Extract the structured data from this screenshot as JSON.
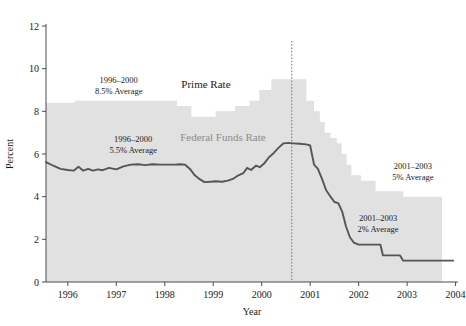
{
  "chart_data": {
    "type": "area",
    "title": "",
    "xlabel": "Year",
    "ylabel": "Percent",
    "xlim": [
      1995.55,
      2004.05
    ],
    "ylim": [
      0,
      12
    ],
    "grid": false,
    "legend_position": "inline-annotation",
    "xticks": [
      "1996",
      "1997",
      "1998",
      "1999",
      "2000",
      "2001",
      "2002",
      "2003",
      "2004"
    ],
    "xtick_values": [
      1996,
      1997,
      1998,
      1999,
      2000,
      2001,
      2002,
      2003,
      2004
    ],
    "yticks": [
      "0",
      "2",
      "4",
      "6",
      "8",
      "10",
      "12"
    ],
    "ytick_values": [
      0,
      2,
      4,
      6,
      8,
      10,
      12
    ],
    "series": [
      {
        "name": "Prime Rate",
        "style": "step-area",
        "color": "#e1e1e1",
        "points": [
          [
            1995.55,
            8.4
          ],
          [
            1996.15,
            8.4
          ],
          [
            1996.15,
            8.5
          ],
          [
            1998.25,
            8.5
          ],
          [
            1998.25,
            8.25
          ],
          [
            1998.55,
            8.25
          ],
          [
            1998.55,
            7.75
          ],
          [
            1999.05,
            7.75
          ],
          [
            1999.05,
            8.0
          ],
          [
            1999.45,
            8.0
          ],
          [
            1999.45,
            8.25
          ],
          [
            1999.75,
            8.25
          ],
          [
            1999.75,
            8.5
          ],
          [
            1999.95,
            8.5
          ],
          [
            1999.95,
            9.0
          ],
          [
            2000.2,
            9.0
          ],
          [
            2000.2,
            9.5
          ],
          [
            2000.92,
            9.5
          ],
          [
            2000.92,
            8.5
          ],
          [
            2001.08,
            8.5
          ],
          [
            2001.08,
            8.0
          ],
          [
            2001.2,
            8.0
          ],
          [
            2001.2,
            7.5
          ],
          [
            2001.3,
            7.5
          ],
          [
            2001.3,
            7.0
          ],
          [
            2001.42,
            7.0
          ],
          [
            2001.42,
            6.75
          ],
          [
            2001.55,
            6.75
          ],
          [
            2001.55,
            6.5
          ],
          [
            2001.65,
            6.5
          ],
          [
            2001.65,
            6.0
          ],
          [
            2001.75,
            6.0
          ],
          [
            2001.75,
            5.5
          ],
          [
            2001.85,
            5.5
          ],
          [
            2001.85,
            5.0
          ],
          [
            2002.05,
            5.0
          ],
          [
            2002.05,
            4.75
          ],
          [
            2002.35,
            4.75
          ],
          [
            2002.35,
            4.25
          ],
          [
            2002.92,
            4.25
          ],
          [
            2002.92,
            4.0
          ],
          [
            2003.72,
            4.0
          ],
          [
            2003.72,
            0
          ],
          [
            1995.55,
            0
          ]
        ]
      },
      {
        "name": "Federal Funds Rate",
        "style": "line",
        "color": "#555555",
        "points": [
          [
            1995.55,
            5.62
          ],
          [
            1995.7,
            5.45
          ],
          [
            1995.85,
            5.3
          ],
          [
            1996.0,
            5.25
          ],
          [
            1996.12,
            5.22
          ],
          [
            1996.22,
            5.4
          ],
          [
            1996.32,
            5.22
          ],
          [
            1996.42,
            5.3
          ],
          [
            1996.52,
            5.22
          ],
          [
            1996.62,
            5.28
          ],
          [
            1996.72,
            5.24
          ],
          [
            1996.85,
            5.35
          ],
          [
            1997.0,
            5.28
          ],
          [
            1997.15,
            5.42
          ],
          [
            1997.3,
            5.5
          ],
          [
            1997.45,
            5.52
          ],
          [
            1997.6,
            5.48
          ],
          [
            1997.75,
            5.52
          ],
          [
            1997.9,
            5.5
          ],
          [
            1998.05,
            5.5
          ],
          [
            1998.2,
            5.5
          ],
          [
            1998.32,
            5.52
          ],
          [
            1998.42,
            5.5
          ],
          [
            1998.52,
            5.3
          ],
          [
            1998.62,
            5.0
          ],
          [
            1998.72,
            4.82
          ],
          [
            1998.82,
            4.68
          ],
          [
            1998.95,
            4.7
          ],
          [
            1999.05,
            4.72
          ],
          [
            1999.18,
            4.7
          ],
          [
            1999.3,
            4.75
          ],
          [
            1999.42,
            4.85
          ],
          [
            1999.52,
            5.0
          ],
          [
            1999.62,
            5.1
          ],
          [
            1999.7,
            5.35
          ],
          [
            1999.78,
            5.25
          ],
          [
            1999.88,
            5.45
          ],
          [
            1999.96,
            5.38
          ],
          [
            2000.05,
            5.55
          ],
          [
            2000.15,
            5.85
          ],
          [
            2000.25,
            6.05
          ],
          [
            2000.35,
            6.3
          ],
          [
            2000.45,
            6.5
          ],
          [
            2000.55,
            6.52
          ],
          [
            2000.65,
            6.5
          ],
          [
            2000.78,
            6.48
          ],
          [
            2000.92,
            6.45
          ],
          [
            2001.0,
            6.4
          ],
          [
            2001.08,
            5.5
          ],
          [
            2001.16,
            5.3
          ],
          [
            2001.25,
            4.8
          ],
          [
            2001.33,
            4.3
          ],
          [
            2001.42,
            4.0
          ],
          [
            2001.5,
            3.75
          ],
          [
            2001.58,
            3.7
          ],
          [
            2001.66,
            3.3
          ],
          [
            2001.74,
            2.6
          ],
          [
            2001.82,
            2.1
          ],
          [
            2001.9,
            1.85
          ],
          [
            2002.0,
            1.75
          ],
          [
            2002.2,
            1.75
          ],
          [
            2002.4,
            1.75
          ],
          [
            2002.45,
            1.75
          ],
          [
            2002.5,
            1.25
          ],
          [
            2002.7,
            1.25
          ],
          [
            2002.85,
            1.25
          ],
          [
            2002.92,
            1.0
          ],
          [
            2003.2,
            1.0
          ],
          [
            2003.5,
            1.0
          ],
          [
            2003.72,
            1.0
          ],
          [
            2003.95,
            1.0
          ]
        ]
      }
    ],
    "annotations": [
      {
        "id": "prime-avg-early",
        "line1": "1996–2000",
        "line2": "8.5% Average",
        "x": 1997.05,
        "y": 9.35
      },
      {
        "id": "ff-avg-early",
        "line1": "1996–2000",
        "line2": "5.5% Average",
        "x": 1997.35,
        "y": 6.55
      },
      {
        "id": "prime-avg-late",
        "line1": "2001–2003",
        "line2": "5% Average",
        "x": 2003.12,
        "y": 5.3
      },
      {
        "id": "ff-avg-late",
        "line1": "2001–2003",
        "line2": "2% Average",
        "x": 2002.4,
        "y": 2.85
      }
    ],
    "series_labels": [
      {
        "id": "prime-rate-label",
        "text": "Prime Rate",
        "x": 1998.85,
        "y": 9.1,
        "color": "#1a1a1a"
      },
      {
        "id": "federal-funds-rate-label",
        "text": "Federal Funds Rate",
        "x": 1999.2,
        "y": 6.62,
        "color": "#8c8c8c"
      }
    ],
    "divider": {
      "id": "period-divider",
      "x": 2000.62,
      "y_top": 11.3,
      "y_bottom": 0,
      "style": "dotted"
    }
  },
  "colors": {
    "area_fill": "#e1e1e1",
    "line": "#555555",
    "axis": "#4a4a4a",
    "text": "#1a1a1a",
    "muted_text": "#8c8c8c",
    "background": "#ffffff"
  }
}
